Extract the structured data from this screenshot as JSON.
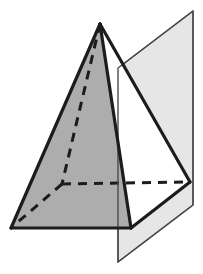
{
  "figure": {
    "title": "Pyramid intersected by a plane",
    "canvas": {
      "width": 203,
      "height": 274,
      "background": "#ffffff"
    },
    "colors": {
      "outline": "#1c1c1c",
      "pyramid_left_face_fill": "#adadad",
      "pyramid_front_face_fill": "#ffffff",
      "plane_fill": "#e6e6e6",
      "plane_stroke": "#4a4a4a",
      "hidden_edge": "#1c1c1c",
      "background": "#ffffff"
    },
    "strokes": {
      "solid_edge_width": 3.2,
      "hidden_edge_width": 3.0,
      "hidden_dash_pattern": "9,7",
      "plane_edge_width": 1.4
    },
    "vertices": {
      "apex": {
        "label": "apex",
        "x": 100,
        "y": 24
      },
      "base_left": {
        "label": "base-left",
        "x": 11,
        "y": 228
      },
      "base_front": {
        "label": "base-front",
        "x": 131,
        "y": 228
      },
      "base_right": {
        "label": "base-right",
        "x": 190,
        "y": 182
      },
      "base_back_hidden": {
        "label": "base-back-hidden",
        "x": 62,
        "y": 184
      }
    },
    "plane_corners": {
      "top_left": {
        "x": 118,
        "y": 68
      },
      "top_right": {
        "x": 193,
        "y": 11
      },
      "bottom_right": {
        "x": 193,
        "y": 205
      },
      "bottom_left": {
        "x": 118,
        "y": 262
      }
    },
    "polygons": {
      "plane": "118,68 193,11 193,205 118,262",
      "pyramid_left_face": "100,24 11,228 62,184",
      "pyramid_base_visible": "11,228 131,228 190,182 62,184",
      "pyramid_front_face": "100,24 131,228 190,182",
      "pyramid_silhouette": "100,24 11,228 131,228 190,182"
    },
    "edges": {
      "apex_to_base_left": "100,24 11,228",
      "apex_to_base_front": "100,24 131,228",
      "apex_to_base_right": "100,24 190,182",
      "base_left_to_base_front": "11,228 131,228",
      "base_front_to_base_right": "131,228 190,182",
      "apex_to_base_back_hidden": "100,24 62,184",
      "base_back_to_base_left_hidden": "62,184 11,228",
      "base_back_to_base_right_hidden": "62,184 190,182"
    }
  }
}
